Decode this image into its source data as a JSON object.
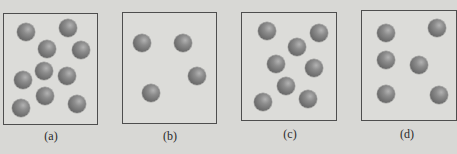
{
  "colors": {
    "background": "#d8d8d5",
    "panel_border": "#4e4e4e",
    "sphere": "#7a7a7a"
  },
  "panels": [
    {
      "label": "(a)",
      "box": {
        "x": 3,
        "y": 13,
        "w": 95,
        "h": 112
      },
      "label_pos": {
        "x": 51,
        "y": 129
      },
      "particle_count": 10,
      "particles": [
        {
          "x": 26,
          "y": 32
        },
        {
          "x": 68,
          "y": 28
        },
        {
          "x": 47,
          "y": 49
        },
        {
          "x": 81,
          "y": 50
        },
        {
          "x": 44,
          "y": 71
        },
        {
          "x": 23,
          "y": 80
        },
        {
          "x": 67,
          "y": 76
        },
        {
          "x": 45,
          "y": 96
        },
        {
          "x": 21,
          "y": 108
        },
        {
          "x": 77,
          "y": 104
        }
      ]
    },
    {
      "label": "(b)",
      "box": {
        "x": 122,
        "y": 12,
        "w": 95,
        "h": 112
      },
      "label_pos": {
        "x": 170,
        "y": 129
      },
      "particle_count": 4,
      "particles": [
        {
          "x": 142,
          "y": 43
        },
        {
          "x": 183,
          "y": 43
        },
        {
          "x": 197,
          "y": 76
        },
        {
          "x": 151,
          "y": 93
        }
      ]
    },
    {
      "label": "(c)",
      "box": {
        "x": 241,
        "y": 12,
        "w": 96,
        "h": 109
      },
      "label_pos": {
        "x": 290,
        "y": 127
      },
      "particle_count": 8,
      "particles": [
        {
          "x": 267,
          "y": 31
        },
        {
          "x": 319,
          "y": 33
        },
        {
          "x": 297,
          "y": 47
        },
        {
          "x": 276,
          "y": 64
        },
        {
          "x": 314,
          "y": 68
        },
        {
          "x": 286,
          "y": 86
        },
        {
          "x": 263,
          "y": 102
        },
        {
          "x": 308,
          "y": 99
        }
      ]
    },
    {
      "label": "(d)",
      "box": {
        "x": 361,
        "y": 10,
        "w": 96,
        "h": 111
      },
      "label_pos": {
        "x": 407,
        "y": 127
      },
      "particle_count": 6,
      "particles": [
        {
          "x": 386,
          "y": 33
        },
        {
          "x": 437,
          "y": 28
        },
        {
          "x": 386,
          "y": 60
        },
        {
          "x": 419,
          "y": 65
        },
        {
          "x": 386,
          "y": 94
        },
        {
          "x": 439,
          "y": 95
        }
      ]
    }
  ]
}
